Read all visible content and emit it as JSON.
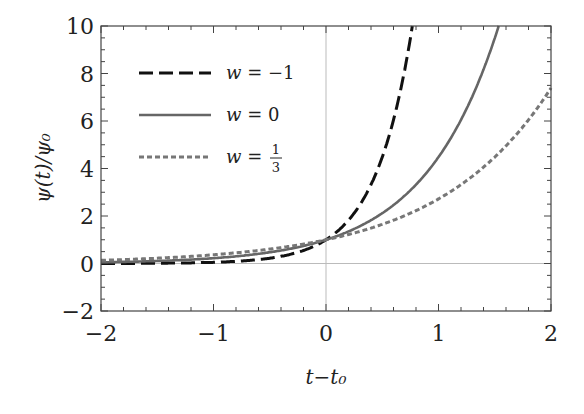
{
  "chart_data": {
    "type": "line",
    "title": "",
    "xlabel": "t−t₀",
    "ylabel": "ψ(t)/ψ₀",
    "xlim": [
      -2,
      2
    ],
    "ylim": [
      -2,
      10
    ],
    "xticks": [
      -2,
      -1,
      0,
      1,
      2
    ],
    "yticks": [
      -2,
      0,
      2,
      4,
      6,
      8,
      10
    ],
    "xtick_labels": [
      "−2",
      "−1",
      "0",
      "1",
      "2"
    ],
    "ytick_labels": [
      "−2",
      "0",
      "2",
      "4",
      "6",
      "8",
      "10"
    ],
    "grid": false,
    "reference_lines": {
      "x": 0,
      "y": 0
    },
    "legend_position": "upper left",
    "x": [
      -2.0,
      -1.5,
      -1.0,
      -0.5,
      0.0,
      0.25,
      0.5,
      0.75,
      1.0,
      1.25,
      1.5,
      1.75,
      2.0
    ],
    "series": [
      {
        "name": "w = −1",
        "style": "dashed",
        "color": "#111111",
        "values": [
          0.0025,
          0.011,
          0.05,
          0.22,
          1.0,
          2.12,
          4.48,
          9.49,
          null,
          null,
          null,
          null,
          null
        ]
      },
      {
        "name": "w = 0",
        "style": "solid",
        "color": "#666666",
        "values": [
          0.05,
          0.105,
          0.22,
          0.47,
          1.0,
          1.45,
          2.12,
          3.08,
          4.48,
          6.52,
          9.49,
          null,
          null
        ]
      },
      {
        "name": "w = 1/3",
        "style": "dotted",
        "color": "#777777",
        "values": [
          0.135,
          0.22,
          0.37,
          0.61,
          1.0,
          1.28,
          1.65,
          2.12,
          2.72,
          3.49,
          4.48,
          5.75,
          7.39
        ]
      }
    ]
  },
  "legend": {
    "items": [
      {
        "label": "w = −1"
      },
      {
        "label": "w = 0"
      },
      {
        "label": "w = 1/3"
      }
    ]
  }
}
